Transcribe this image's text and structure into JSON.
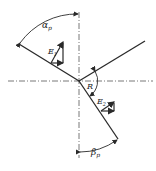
{
  "diagram": {
    "type": "optics-reflection-refraction",
    "colors": {
      "stroke": "#2a2a2a",
      "axis": "#555555",
      "background": "#ffffff"
    },
    "labels": {
      "alpha": "α",
      "alpha_sub": "p",
      "beta": "β",
      "beta_sub": "p",
      "E1": "E",
      "E1_sub": "1",
      "E2": "E",
      "E2_sub": "2",
      "R": "R"
    },
    "geometry": {
      "origin": [
        79,
        81
      ],
      "incident_ray_start": [
        19,
        44
      ],
      "reflected_ray_end": [
        145,
        41
      ],
      "refracted_ray_end": [
        118,
        139
      ]
    }
  }
}
